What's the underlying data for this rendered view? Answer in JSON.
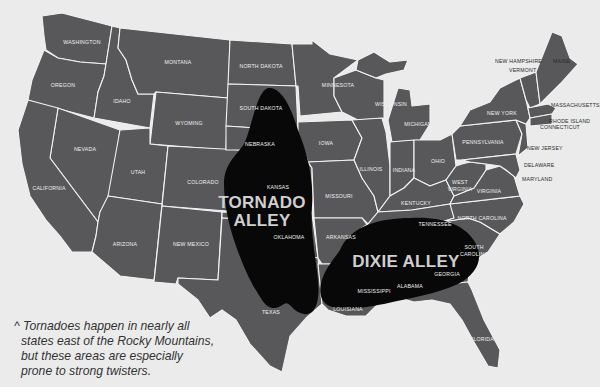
{
  "map": {
    "title": "US Tornado Alleys",
    "colors": {
      "background": "#ebebeb",
      "state_fill": "#58585a",
      "state_border": "#f2f2f2",
      "alley_fill": "#080808",
      "alley_label": "#cfcfcf",
      "caption_text": "#333333"
    },
    "regions": [
      {
        "name": "Tornado Alley",
        "label_line1": "TORNADO",
        "label_line2": "ALLEY"
      },
      {
        "name": "Dixie Alley",
        "label_line1": "DIXIE ALLEY"
      }
    ],
    "states": {
      "washington": "WASHINGTON",
      "oregon": "OREGON",
      "idaho": "IDAHO",
      "montana": "MONTANA",
      "wyoming": "WYOMING",
      "nevada": "NEVADA",
      "california": "CALIFORNIA",
      "utah": "UTAH",
      "colorado": "COLORADO",
      "arizona": "ARIZONA",
      "new_mexico": "NEW MEXICO",
      "north_dakota": "NORTH DAKOTA",
      "south_dakota": "SOUTH DAKOTA",
      "nebraska": "NEBRASKA",
      "kansas": "KANSAS",
      "oklahoma": "OKLAHOMA",
      "texas": "TEXAS",
      "minnesota": "MINNESOTA",
      "iowa": "IOWA",
      "missouri": "MISSOURI",
      "arkansas": "ARKANSAS",
      "louisiana": "LOUISIANA",
      "wisconsin": "WISCONSIN",
      "illinois": "ILLINOIS",
      "michigan": "MICHIGAN",
      "indiana": "INDIANA",
      "ohio": "OHIO",
      "kentucky": "KENTUCKY",
      "tennessee": "TENNESSEE",
      "mississippi": "MISSISSIPPI",
      "alabama": "ALABAMA",
      "georgia": "GEORGIA",
      "florida": "FLORIDA",
      "south_carolina": "SOUTH CAROLINA",
      "north_carolina": "NORTH CAROLINA",
      "virginia": "VIRGINIA",
      "west_virginia": "WEST VIRGINIA",
      "pennsylvania": "PENNSYLVANIA",
      "new_york": "NEW YORK",
      "new_jersey": "NEW JERSEY",
      "delaware": "DELAWARE",
      "maryland": "MARYLAND",
      "connecticut": "CONNECTICUT",
      "rhode_island": "RHODE ISLAND",
      "massachusetts": "MASSACHUSETTS",
      "vermont": "VERMONT",
      "new_hampshire": "NEW HAMPSHIRE",
      "maine": "MAINE"
    },
    "caption": {
      "line1": "^ Tornadoes happen in nearly all",
      "line2": "states east of the Rocky Mountains,",
      "line3": "but these areas are especially",
      "line4": "prone to strong twisters."
    }
  }
}
